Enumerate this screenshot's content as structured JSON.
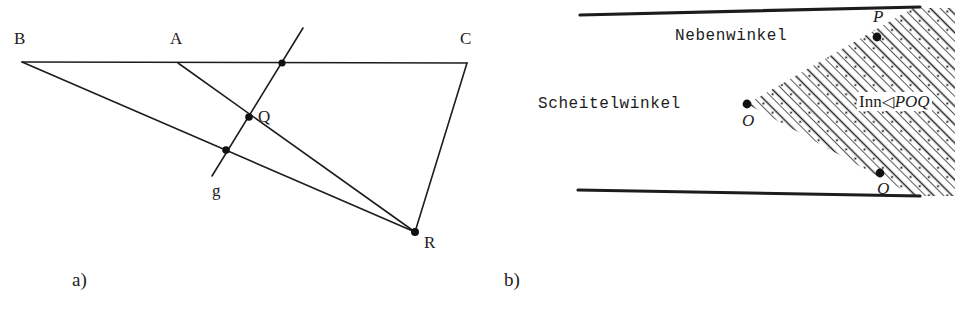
{
  "figure": {
    "width": 967,
    "height": 316,
    "background_color": "#ffffff",
    "ink_color": "#1c1c1c"
  },
  "panel_a": {
    "caption": "a)",
    "description": "Triangle-like configuration with line BC, points A and B on it, a transversal line g crossing segments, point Q and point R.",
    "labels": {
      "B": "B",
      "A": "A",
      "C": "C",
      "Q": "Q",
      "R": "R",
      "g": "g"
    },
    "points": [
      {
        "name": "B",
        "x": 22,
        "y": 62,
        "dot": false,
        "label_x": 14,
        "label_y": 30
      },
      {
        "name": "A",
        "x": 178,
        "y": 63,
        "dot": false,
        "label_x": 170,
        "label_y": 30
      },
      {
        "name": "C",
        "x": 467,
        "y": 63,
        "dot": false,
        "label_x": 460,
        "label_y": 30
      },
      {
        "name": "S",
        "x": 282,
        "y": 63,
        "dot": true,
        "label_x": null,
        "label_y": null
      },
      {
        "name": "Q",
        "x": 249,
        "y": 117,
        "dot": true,
        "label_x": 258,
        "label_y": 108
      },
      {
        "name": "T",
        "x": 226,
        "y": 150,
        "dot": true,
        "label_x": null,
        "label_y": null
      },
      {
        "name": "R",
        "x": 415,
        "y": 232,
        "dot": true,
        "label_x": 424,
        "label_y": 234
      },
      {
        "name": "g",
        "x": 212,
        "y": 176,
        "dot": false,
        "label_x": 212,
        "label_y": 180
      }
    ],
    "segments": [
      {
        "name": "line-BC",
        "x1": 22,
        "y1": 62,
        "x2": 467,
        "y2": 63
      },
      {
        "name": "line-BR",
        "x1": 22,
        "y1": 62,
        "x2": 415,
        "y2": 232
      },
      {
        "name": "line-AR",
        "x1": 178,
        "y1": 63,
        "x2": 415,
        "y2": 232
      },
      {
        "name": "line-CR",
        "x1": 467,
        "y1": 63,
        "x2": 415,
        "y2": 232
      },
      {
        "name": "line-g",
        "x1": 212,
        "y1": 176,
        "x2": 303,
        "y2": 28
      }
    ]
  },
  "panel_b": {
    "caption": "b)",
    "description": "Two intersecting lines through vertex O; rays OP and OQ bound the shaded interior of angle POQ; the opposite region is the Scheitelwinkel and the adjacent region the Nebenwinkel.",
    "labels": {
      "nebenwinkel": "Nebenwinkel",
      "scheitelwinkel": "Scheitelwinkel",
      "inn_prefix": "Inn",
      "angle_symbol": "◁",
      "angle_name": "POQ",
      "O": "O",
      "P": "P",
      "Q": "Q"
    },
    "points": [
      {
        "name": "O",
        "x": 257,
        "y": 104,
        "dot": true,
        "label_x": 252,
        "label_y": 112
      },
      {
        "name": "P",
        "x": 387,
        "y": 37,
        "dot": true,
        "label_x": 383,
        "label_y": 8
      },
      {
        "name": "Q",
        "x": 390,
        "y": 173,
        "dot": true,
        "label_x": 387,
        "label_y": 180
      }
    ],
    "segments": [
      {
        "name": "line-PO-extended",
        "x1": 90,
        "y1": 15,
        "x2": 430,
        "y2": 7
      },
      {
        "name": "line-QO-extended",
        "x1": 88,
        "y1": 190,
        "x2": 430,
        "y2": 196
      }
    ],
    "shaded_region": {
      "name": "interior-angle-POQ",
      "fill": "hatch-dot",
      "vertices": "O(257,104) -> along ray OP to right edge -> down right edge -> back along ray OQ to O"
    },
    "text_positions": {
      "nebenwinkel_x": 185,
      "nebenwinkel_y": 28,
      "scheitelwinkel_x": 48,
      "scheitelwinkel_y": 96,
      "inn_x": 367,
      "inn_y": 92
    }
  },
  "captions": {
    "a_x": 72,
    "a_y": 270,
    "b_x": 504,
    "b_y": 270
  }
}
